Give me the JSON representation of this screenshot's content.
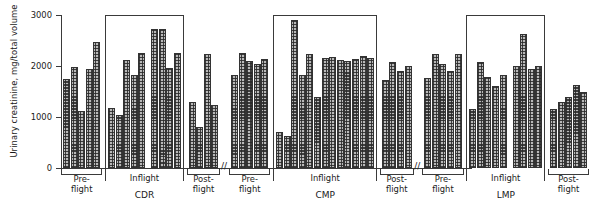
{
  "chart": {
    "ylabel": "Urinary creatinine, mg/total volume",
    "yticks": [
      0,
      1000,
      2000,
      3000
    ],
    "ylim": [
      0,
      3000
    ],
    "inflight_label": "Inflight",
    "preflight_label": "Pre-\nflight",
    "postflight_label": "Post-\nflight",
    "break_glyph": "//"
  },
  "chart_data": {
    "type": "bar",
    "title": "",
    "xlabel": "",
    "ylabel": "Urinary creatinine, mg/total volume",
    "ylim": [
      0,
      3000
    ],
    "yticks": [
      0,
      1000,
      2000,
      3000
    ],
    "grid": false,
    "legend": "none",
    "axis_breaks_between_subjects": true,
    "groups": [
      {
        "subject": "CDR",
        "phases": [
          {
            "phase": "Pre-flight",
            "values": [
              1750,
              1980,
              1110,
              1950,
              2480
            ]
          },
          {
            "phase": "Inflight",
            "values": [
              1180,
              1030,
              2120,
              1830,
              2260,
              null,
              2720,
              2730,
              1960,
              2260
            ]
          },
          {
            "phase": "Post-flight",
            "values": [
              1290,
              810,
              2230,
              1240
            ]
          }
        ]
      },
      {
        "subject": "CMP",
        "phases": [
          {
            "phase": "Pre-flight",
            "values": [
              1830,
              2250,
              2100,
              2030,
              2130
            ]
          },
          {
            "phase": "Inflight",
            "values": [
              710,
              620,
              2900,
              1830,
              2230,
              1400,
              2150,
              2180,
              2120,
              2100,
              2130,
              2190,
              2150
            ]
          },
          {
            "phase": "Post-flight",
            "values": [
              1720,
              2070,
              1900,
              2000
            ]
          }
        ]
      },
      {
        "subject": "LMP",
        "phases": [
          {
            "phase": "Pre-flight",
            "values": [
              1760,
              2240,
              2030,
              1900,
              2240
            ]
          },
          {
            "phase": "Inflight",
            "values": [
              1150,
              2070,
              1790,
              1610,
              1830,
              null,
              2000,
              2620,
              1950,
              2000
            ]
          },
          {
            "phase": "Post-flight",
            "values": [
              1150,
              1290,
              1400,
              1630,
              1500
            ]
          }
        ]
      }
    ]
  },
  "labels": {
    "subjects": [
      "CDR",
      "CMP",
      "LMP"
    ],
    "phases": [
      "Pre-flight",
      "Inflight",
      "Post-flight"
    ]
  }
}
